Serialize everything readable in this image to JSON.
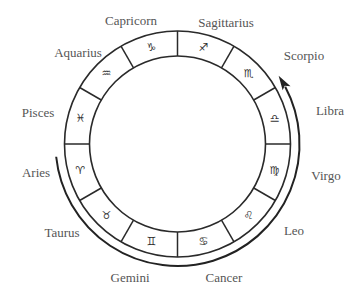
{
  "diagram": {
    "colors": {
      "line": "#2a2a2a",
      "label": "#555555",
      "glyph": "#333333",
      "background": "#ffffff"
    },
    "geometry": {
      "center": [
        177.5,
        144
      ],
      "outer_radius": 113,
      "inner_radius": 88,
      "arrow_radius": 122
    },
    "arrow": {
      "direction": "counter-clockwise",
      "from_sign": "Aries",
      "to_sign": "Libra",
      "description": "Arrow arc runs from Aries along the bottom of the wheel to Libra"
    },
    "signs": [
      {
        "name": "Aries",
        "glyph": "♈",
        "label_x": 36,
        "label_y": 172,
        "angle": 195
      },
      {
        "name": "Taurus",
        "glyph": "♉",
        "label_x": 62,
        "label_y": 232,
        "angle": 225
      },
      {
        "name": "Gemini",
        "glyph": "♊",
        "label_x": 130,
        "label_y": 277,
        "angle": 255
      },
      {
        "name": "Cancer",
        "glyph": "♋",
        "label_x": 224,
        "label_y": 277,
        "angle": 285
      },
      {
        "name": "Leo",
        "glyph": "♌",
        "label_x": 294,
        "label_y": 230,
        "angle": 315
      },
      {
        "name": "Virgo",
        "glyph": "♍",
        "label_x": 326,
        "label_y": 175,
        "angle": 345
      },
      {
        "name": "Libra",
        "glyph": "♎",
        "label_x": 330,
        "label_y": 110,
        "angle": 15
      },
      {
        "name": "Scorpio",
        "glyph": "♏",
        "label_x": 304,
        "label_y": 55,
        "angle": 45
      },
      {
        "name": "Sagittarius",
        "glyph": "♐",
        "label_x": 226,
        "label_y": 22,
        "angle": 75
      },
      {
        "name": "Capricorn",
        "glyph": "♑",
        "label_x": 131,
        "label_y": 20,
        "angle": 105
      },
      {
        "name": "Aquarius",
        "glyph": "♒",
        "label_x": 78,
        "label_y": 52,
        "angle": 135
      },
      {
        "name": "Pisces",
        "glyph": "♓",
        "label_x": 38,
        "label_y": 112,
        "angle": 165
      }
    ]
  }
}
